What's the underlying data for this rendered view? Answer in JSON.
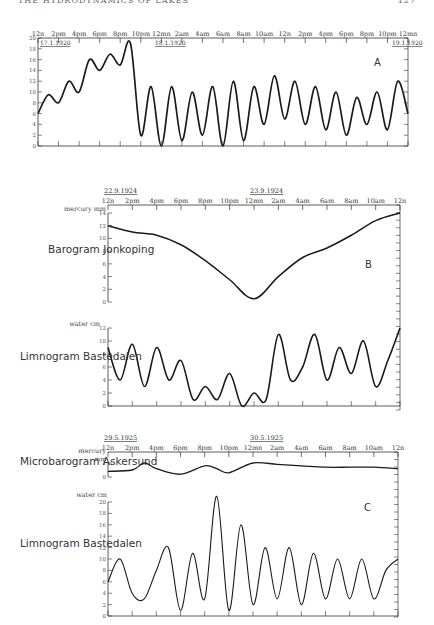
{
  "page": {
    "running_title": "THE HYDRODYNAMICS OF LAKES",
    "page_number": "127"
  },
  "chart_data": [
    {
      "panel": "A",
      "type": "line",
      "title": "",
      "xlabel": "",
      "ylabel": "",
      "ylim": [
        0,
        20
      ],
      "yticks": [
        "0",
        "2",
        "4",
        "6",
        "8",
        "10",
        "12",
        "14",
        "16",
        "18",
        "20"
      ],
      "date_labels": [
        "17.1.1920",
        "18.1.1920",
        "19.1.1920"
      ],
      "x_ticks": [
        "12n",
        "2pm",
        "4pm",
        "6pm",
        "8pm",
        "10pm",
        "12mn",
        "2am",
        "4am",
        "6am",
        "8am",
        "10am",
        "12n",
        "2pm",
        "4pm",
        "6pm",
        "8pm",
        "10pm",
        "12mn"
      ],
      "series": [
        {
          "name": "A",
          "x": [
            0,
            1,
            2,
            3,
            4,
            5,
            6,
            7,
            8,
            9,
            10,
            11,
            12,
            13,
            14,
            15,
            16,
            17,
            18,
            19,
            20,
            21,
            22,
            23,
            24,
            25,
            26,
            27,
            28,
            29,
            30,
            31,
            32,
            33,
            34,
            35,
            36
          ],
          "values": [
            6,
            9.5,
            8,
            12,
            10,
            16,
            14,
            17,
            15,
            19,
            2,
            11,
            0,
            11,
            1,
            10,
            2,
            11,
            0,
            12,
            1,
            11,
            4,
            13,
            5,
            12,
            4,
            11,
            3,
            10,
            2,
            9,
            4,
            10,
            3,
            12,
            6
          ]
        }
      ]
    },
    {
      "panel": "B",
      "type": "line",
      "date_labels": [
        "22.9.1924",
        "23.9.1924"
      ],
      "x_ticks": [
        "12n",
        "2pm",
        "4pm",
        "6pm",
        "8pm",
        "10pm",
        "12mn",
        "2am",
        "4am",
        "6am",
        "8am",
        "10am",
        "12n"
      ],
      "subplots": [
        {
          "name": "Barogram Jonkoping",
          "ylabel": "mercury mm",
          "ylim": [
            0,
            14
          ],
          "yticks": [
            "0",
            "2",
            "4",
            "6",
            "8",
            "10",
            "12",
            "14"
          ],
          "x": [
            0,
            2,
            4,
            6,
            8,
            10,
            12,
            14,
            16,
            18,
            20,
            22,
            24
          ],
          "values": [
            12,
            11,
            10.5,
            9,
            6.5,
            3.5,
            0.5,
            4,
            7,
            8.5,
            10.5,
            12.8,
            14
          ]
        },
        {
          "name": "Limnogram Bastedalen",
          "ylabel": "water cm",
          "ylim": [
            0,
            12
          ],
          "yticks": [
            "0",
            "2",
            "4",
            "6",
            "8",
            "10",
            "12"
          ],
          "x": [
            0,
            1,
            2,
            3,
            4,
            5,
            6,
            7,
            8,
            9,
            10,
            11,
            12,
            13,
            14,
            15,
            16,
            17,
            18,
            19,
            20,
            21,
            22,
            23,
            24
          ],
          "values": [
            9,
            4,
            9.5,
            3,
            9,
            4,
            7,
            1,
            3,
            1,
            5,
            0,
            2,
            1,
            11,
            4,
            6,
            11,
            4,
            9,
            5,
            10,
            3,
            7,
            12
          ]
        }
      ],
      "panel_label": "B"
    },
    {
      "panel": "C",
      "type": "line",
      "date_labels": [
        "29.5.1925",
        "30.5.1925"
      ],
      "x_ticks": [
        "12n",
        "2pm",
        "4pm",
        "6pm",
        "8pm",
        "10pm",
        "12mn",
        "2am",
        "4am",
        "6am",
        "8am",
        "10am",
        "12n"
      ],
      "subplots": [
        {
          "name": "Microbarogram Askersund",
          "ylabel": "mercury mm",
          "ylim": [
            0,
            1
          ],
          "yticks": [
            "0",
            "1"
          ],
          "x": [
            0,
            2,
            3,
            4,
            6,
            8,
            9,
            10,
            12,
            14,
            16,
            18,
            20,
            22,
            24
          ],
          "values": [
            0.4,
            0.5,
            1.0,
            0.6,
            0.2,
            0.8,
            0.6,
            0.3,
            1.0,
            0.9,
            0.8,
            0.7,
            0.7,
            0.7,
            0.6
          ]
        },
        {
          "name": "Limnogram Bastedalen",
          "ylabel": "water cm",
          "ylim": [
            0,
            20
          ],
          "yticks": [
            "0",
            "2",
            "4",
            "6",
            "8",
            "10",
            "12",
            "14",
            "16",
            "18",
            "20"
          ],
          "x": [
            0,
            1,
            2,
            3,
            4,
            5,
            6,
            7,
            8,
            9,
            10,
            11,
            12,
            13,
            14,
            15,
            16,
            17,
            18,
            19,
            20,
            21,
            22,
            23,
            24
          ],
          "values": [
            6,
            10,
            4,
            3,
            8,
            12,
            1,
            11,
            3,
            21,
            1,
            16,
            2,
            12,
            3,
            12,
            2,
            11,
            3,
            10,
            3,
            10,
            3,
            8,
            10
          ]
        }
      ],
      "panel_label": "C"
    }
  ]
}
